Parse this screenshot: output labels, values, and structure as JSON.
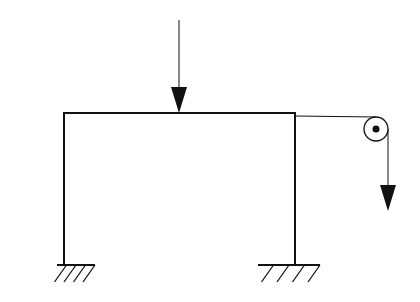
{
  "diagram": {
    "type": "structural-frame",
    "colors": {
      "stroke": "#111111",
      "background": "#ffffff"
    },
    "frame": {
      "beam": {
        "x1": 64,
        "y1": 113,
        "x2": 295,
        "y2": 113
      },
      "left_column": {
        "x1": 64,
        "y1": 113,
        "x2": 64,
        "y2": 265
      },
      "right_column": {
        "x1": 295,
        "y1": 113,
        "x2": 295,
        "y2": 265
      }
    },
    "supports": [
      {
        "name": "left-fixed-support",
        "x": 64,
        "y": 265,
        "ground_from": 57,
        "ground_to": 95,
        "hatch_count": 4
      },
      {
        "name": "right-fixed-support",
        "x": 295,
        "y": 265,
        "ground_from": 258,
        "ground_to": 320,
        "hatch_count": 4
      }
    ],
    "loads": [
      {
        "name": "beam-point-load",
        "x": 179,
        "y_start": 20,
        "y_end": 113,
        "direction": "down"
      },
      {
        "name": "cable-hanging-load",
        "x": 388,
        "y_start": 129,
        "y_end": 211,
        "direction": "down"
      }
    ],
    "pulley": {
      "cx": 376,
      "cy": 129,
      "r": 12,
      "axle_r": 3.5
    },
    "cable": {
      "from_x": 295,
      "from_y": 116,
      "to_x": 376,
      "to_y": 117
    }
  }
}
